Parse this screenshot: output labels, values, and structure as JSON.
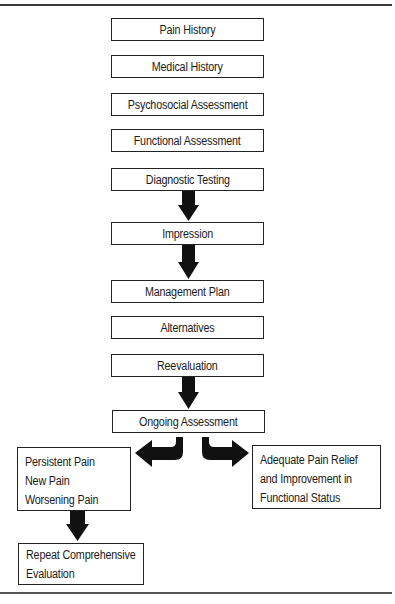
{
  "diagram": {
    "type": "flowchart",
    "steps": [
      {
        "id": "pain-history",
        "label": "Pain History"
      },
      {
        "id": "medical-history",
        "label": "Medical History"
      },
      {
        "id": "psychosocial-assessment",
        "label": "Psychosocial Assessment"
      },
      {
        "id": "functional-assessment",
        "label": "Functional Assessment"
      },
      {
        "id": "diagnostic-testing",
        "label": "Diagnostic Testing"
      },
      {
        "id": "impression",
        "label": "Impression"
      },
      {
        "id": "management-plan",
        "label": "Management Plan"
      },
      {
        "id": "alternatives",
        "label": "Alternatives"
      },
      {
        "id": "reevaluation",
        "label": "Reevaluation"
      },
      {
        "id": "ongoing-assessment",
        "label": "Ongoing Assessment"
      }
    ],
    "branches": {
      "left": {
        "lines": [
          "Persistent Pain",
          "New Pain",
          "Worsening Pain"
        ]
      },
      "right": {
        "lines": [
          "Adequate Pain Relief",
          "and Improvement in",
          "Functional Status"
        ]
      },
      "left_followup": {
        "lines": [
          "Repeat Comprehensive",
          "Evaluation"
        ]
      }
    },
    "arrows": [
      {
        "from": "Diagnostic Testing",
        "to": "Impression"
      },
      {
        "from": "Impression",
        "to": "Management Plan"
      },
      {
        "from": "Reevaluation",
        "to": "Ongoing Assessment"
      },
      {
        "from": "Ongoing Assessment",
        "to": "Persistent Pain / New Pain / Worsening Pain"
      },
      {
        "from": "Ongoing Assessment",
        "to": "Adequate Pain Relief and Improvement in Functional Status"
      },
      {
        "from": "Persistent Pain / New Pain / Worsening Pain",
        "to": "Repeat Comprehensive Evaluation"
      }
    ],
    "colors": {
      "border": "#222222",
      "arrow_fill": "#111111",
      "background": "#ffffff",
      "rule": "#3a3a3a"
    }
  }
}
